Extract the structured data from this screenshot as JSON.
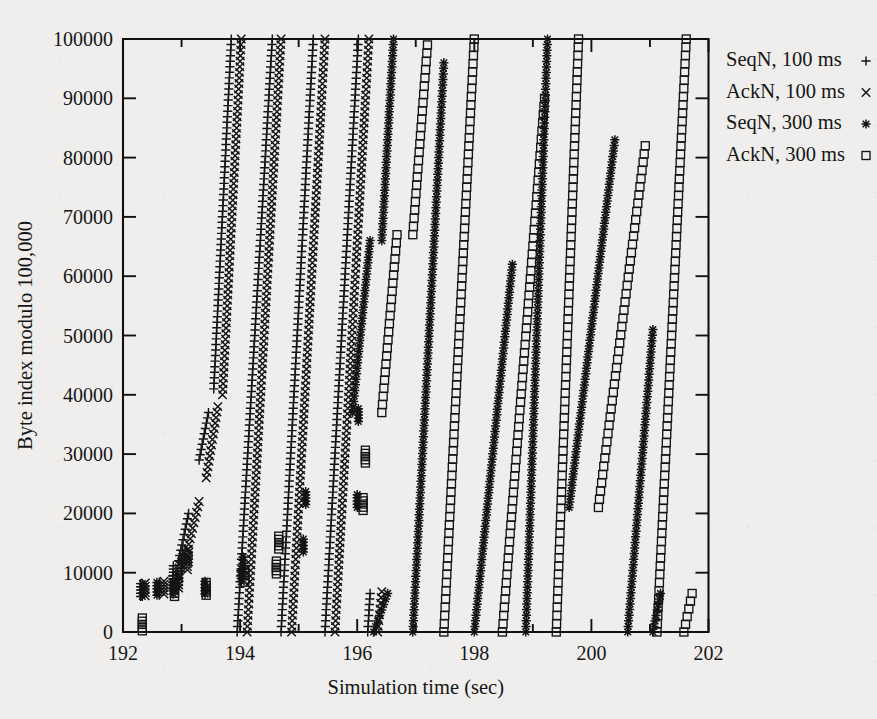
{
  "figure": {
    "background_color": "#efeeec",
    "ink_color": "#141414"
  },
  "axes": {
    "x": {
      "label": "Simulation time (sec)",
      "ticks": [
        "192",
        "194",
        "196",
        "198",
        "200",
        "202"
      ],
      "min": 192,
      "max": 202,
      "minor_step": 0.5
    },
    "y": {
      "label": "Byte index modulo 100,000",
      "ticks": [
        "0",
        "10000",
        "20000",
        "30000",
        "40000",
        "50000",
        "60000",
        "70000",
        "80000",
        "90000",
        "100000"
      ],
      "min": 0,
      "max": 100000
    }
  },
  "legend": {
    "position": "outside-right-top",
    "entries": [
      {
        "label": "SeqN, 100 ms",
        "marker": "plus-icon",
        "marker_char": "+"
      },
      {
        "label": "AckN, 100 ms",
        "marker": "cross-icon",
        "marker_char": "×"
      },
      {
        "label": "SeqN, 300 ms",
        "marker": "asterisk-icon",
        "marker_char": "✳"
      },
      {
        "label": "AckN, 300 ms",
        "marker": "square-icon",
        "marker_char": "□"
      }
    ]
  },
  "chart_data": {
    "type": "scatter",
    "title": "",
    "xlabel": "Simulation time (sec)",
    "ylabel": "Byte index modulo 100,000",
    "xlim": [
      192,
      202
    ],
    "ylim": [
      0,
      100000
    ],
    "grid": false,
    "legend_position": "outside-right-top",
    "series": [
      {
        "name": "SeqN, 100 ms",
        "marker": "plus",
        "slow_start_bursts": [
          {
            "x": 192.3,
            "y": 6000
          },
          {
            "x": 192.62,
            "y": 6200
          },
          {
            "x": 192.85,
            "y": 7300
          },
          {
            "x": 192.86,
            "y": 9000
          },
          {
            "x": 193.0,
            "y": 10200
          },
          {
            "x": 193.02,
            "y": 11600
          }
        ],
        "ramps": [
          {
            "x_start": 192.95,
            "y_start": 12000,
            "x_end": 193.12,
            "y_end": 20000
          },
          {
            "x_start": 193.3,
            "y_start": 29000,
            "x_end": 193.46,
            "y_end": 37000
          },
          {
            "x_start": 193.55,
            "y_start": 41000,
            "x_end": 193.85,
            "y_end": 100000
          },
          {
            "x_start": 193.95,
            "y_start": 0,
            "x_end": 194.55,
            "y_end": 100000
          },
          {
            "x_start": 194.7,
            "y_start": 0,
            "x_end": 195.25,
            "y_end": 100000
          },
          {
            "x_start": 195.45,
            "y_start": 0,
            "x_end": 196.02,
            "y_end": 100000
          },
          {
            "x_start": 196.18,
            "y_start": 0,
            "x_end": 196.22,
            "y_end": 6500
          }
        ]
      },
      {
        "name": "AckN, 100 ms",
        "marker": "cross",
        "slow_start_bursts": [
          {
            "x": 192.38,
            "y": 6100
          },
          {
            "x": 192.7,
            "y": 6400
          },
          {
            "x": 192.95,
            "y": 7400
          },
          {
            "x": 192.96,
            "y": 9200
          },
          {
            "x": 193.1,
            "y": 10500
          },
          {
            "x": 193.12,
            "y": 11800
          }
        ],
        "ramps": [
          {
            "x_start": 193.08,
            "y_start": 13000,
            "x_end": 193.3,
            "y_end": 22000
          },
          {
            "x_start": 193.42,
            "y_start": 26000,
            "x_end": 193.62,
            "y_end": 38000
          },
          {
            "x_start": 193.7,
            "y_start": 40000,
            "x_end": 194.02,
            "y_end": 100000
          },
          {
            "x_start": 194.12,
            "y_start": 0,
            "x_end": 194.7,
            "y_end": 100000
          },
          {
            "x_start": 194.88,
            "y_start": 0,
            "x_end": 195.45,
            "y_end": 100000
          },
          {
            "x_start": 195.62,
            "y_start": 0,
            "x_end": 196.2,
            "y_end": 100000
          },
          {
            "x_start": 196.35,
            "y_start": 0,
            "x_end": 196.42,
            "y_end": 6800
          }
        ]
      },
      {
        "name": "SeqN, 300 ms",
        "marker": "asterisk",
        "slow_start_bursts": [
          {
            "x": 192.33,
            "y": 6000
          },
          {
            "x": 192.58,
            "y": 6200
          },
          {
            "x": 192.86,
            "y": 6400
          },
          {
            "x": 193.4,
            "y": 6400
          },
          {
            "x": 194.02,
            "y": 8500
          },
          {
            "x": 194.05,
            "y": 10500
          },
          {
            "x": 195.08,
            "y": 13500
          },
          {
            "x": 195.12,
            "y": 21500
          },
          {
            "x": 196.0,
            "y": 21000
          },
          {
            "x": 196.02,
            "y": 35500
          }
        ],
        "ramps": [
          {
            "x_start": 195.92,
            "y_start": 37000,
            "x_end": 196.22,
            "y_end": 66000
          },
          {
            "x_start": 196.28,
            "y_start": 0,
            "x_end": 196.52,
            "y_end": 6500
          },
          {
            "x_start": 196.42,
            "y_start": 66000,
            "x_end": 196.62,
            "y_end": 100000
          },
          {
            "x_start": 196.95,
            "y_start": 0,
            "x_end": 197.48,
            "y_end": 96000
          },
          {
            "x_start": 198.0,
            "y_start": 0,
            "x_end": 198.65,
            "y_end": 62000
          },
          {
            "x_start": 198.88,
            "y_start": 0,
            "x_end": 199.25,
            "y_end": 100000
          },
          {
            "x_start": 199.62,
            "y_start": 21000,
            "x_end": 200.4,
            "y_end": 83000
          },
          {
            "x_start": 200.62,
            "y_start": 0,
            "x_end": 201.05,
            "y_end": 51000
          },
          {
            "x_start": 201.05,
            "y_start": 0,
            "x_end": 201.18,
            "y_end": 6500
          }
        ]
      },
      {
        "name": "AckN, 300 ms",
        "marker": "square",
        "slow_start_bursts": [
          {
            "x": 192.33,
            "y": 200
          },
          {
            "x": 192.88,
            "y": 6000
          },
          {
            "x": 193.42,
            "y": 6200
          },
          {
            "x": 194.08,
            "y": 8400
          },
          {
            "x": 194.62,
            "y": 9800
          },
          {
            "x": 194.66,
            "y": 14000
          },
          {
            "x": 196.1,
            "y": 20500
          },
          {
            "x": 196.14,
            "y": 28500
          }
        ],
        "ramps": [
          {
            "x_start": 196.42,
            "y_start": 37000,
            "x_end": 196.68,
            "y_end": 67000
          },
          {
            "x_start": 196.95,
            "y_start": 67000,
            "x_end": 197.2,
            "y_end": 99000
          },
          {
            "x_start": 197.48,
            "y_start": 0,
            "x_end": 198.0,
            "y_end": 100000
          },
          {
            "x_start": 198.48,
            "y_start": 0,
            "x_end": 199.2,
            "y_end": 90000
          },
          {
            "x_start": 199.4,
            "y_start": 0,
            "x_end": 199.78,
            "y_end": 100000
          },
          {
            "x_start": 200.12,
            "y_start": 21000,
            "x_end": 200.92,
            "y_end": 82000
          },
          {
            "x_start": 201.12,
            "y_start": 0,
            "x_end": 201.62,
            "y_end": 100000
          },
          {
            "x_start": 201.58,
            "y_start": 0,
            "x_end": 201.72,
            "y_end": 6500
          }
        ]
      }
    ]
  }
}
